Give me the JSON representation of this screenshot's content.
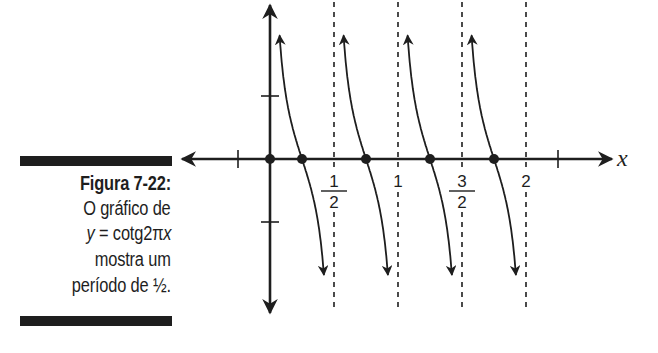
{
  "caption": {
    "title": "Figura 7-22:",
    "line1": "O gráfico de",
    "line2_var": "y",
    "line2_eq": " = cotg2π",
    "line2_x": "x",
    "line3": "mostra um",
    "line4": "período de ½."
  },
  "chart_data": {
    "type": "line",
    "title": "y = cotg2πx",
    "function": "y = cot(2πx)",
    "period": 0.5,
    "xlabel": "x",
    "ylabel": "",
    "x_ticks": [
      {
        "value": -0.25,
        "label": ""
      },
      {
        "value": 0.5,
        "label": "1/2",
        "numerator": "1",
        "denominator": "2"
      },
      {
        "value": 1,
        "label": "1"
      },
      {
        "value": 1.5,
        "label": "3/2",
        "numerator": "3",
        "denominator": "2"
      },
      {
        "value": 2,
        "label": "2"
      },
      {
        "value": 2.25,
        "label": ""
      }
    ],
    "y_ticks": [
      {
        "value": 1,
        "label": ""
      },
      {
        "value": -1,
        "label": ""
      }
    ],
    "vertical_asymptotes": [
      0,
      0.5,
      1,
      1.5,
      2
    ],
    "zeros": [
      0.25,
      0.75,
      1.25,
      1.75
    ],
    "marked_points": [
      {
        "x": 0,
        "y": 0
      },
      {
        "x": 0.25,
        "y": 0
      },
      {
        "x": 0.75,
        "y": 0
      },
      {
        "x": 1.25,
        "y": 0
      },
      {
        "x": 1.75,
        "y": 0
      }
    ],
    "branches": [
      {
        "from": 0,
        "to": 0.5
      },
      {
        "from": 0.5,
        "to": 1
      },
      {
        "from": 1,
        "to": 1.5
      },
      {
        "from": 1.5,
        "to": 2
      }
    ],
    "xlim": [
      -0.75,
      2.7
    ],
    "ylim": [
      -2.4,
      2.5
    ],
    "grid": false,
    "legend": null
  },
  "layout": {
    "origin_px": [
      270,
      159
    ],
    "x_unit_px": 128,
    "y_unit_px": 63,
    "ink_color": "#1e1e1e"
  }
}
